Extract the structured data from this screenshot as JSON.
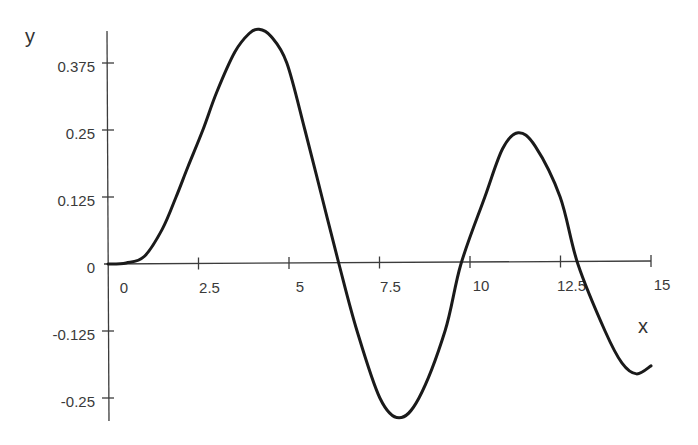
{
  "chart_data": {
    "type": "line",
    "title": "",
    "xlabel": "x",
    "ylabel": "y",
    "xlim": [
      0,
      15
    ],
    "ylim": [
      -0.29,
      0.44
    ],
    "grid": false,
    "legend": "none",
    "x_ticks": [
      0,
      2.5,
      5,
      7.5,
      10,
      12.5,
      15
    ],
    "x_tick_labels": [
      "0",
      "2.5",
      "5",
      "7.5",
      "10",
      "12.5",
      "15"
    ],
    "y_ticks": [
      -0.25,
      -0.125,
      0,
      0.125,
      0.25,
      0.375
    ],
    "y_tick_labels": [
      "-0.25",
      "-0.125",
      "0",
      "0.125",
      "0.25",
      "0.375"
    ],
    "series": [
      {
        "name": "y",
        "color": "#1a1a1a",
        "x": [
          0,
          0.5,
          1.0,
          1.5,
          1.88,
          2.2,
          2.62,
          3.0,
          3.5,
          3.9,
          4.17,
          4.5,
          4.94,
          5.44,
          5.91,
          6.38,
          6.88,
          7.51,
          8.04,
          8.59,
          9.31,
          9.75,
          10.41,
          10.9,
          11.33,
          11.8,
          12.49,
          12.98,
          13.73,
          14.2,
          14.6,
          15.0
        ],
        "y": [
          0,
          0.002,
          0.014,
          0.065,
          0.125,
          0.18,
          0.25,
          0.32,
          0.395,
          0.43,
          0.438,
          0.425,
          0.375,
          0.25,
          0.125,
          0,
          -0.125,
          -0.25,
          -0.287,
          -0.25,
          -0.125,
          0,
          0.125,
          0.215,
          0.245,
          0.22,
          0.125,
          0,
          -0.125,
          -0.185,
          -0.205,
          -0.19
        ]
      }
    ]
  }
}
